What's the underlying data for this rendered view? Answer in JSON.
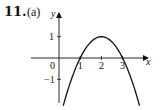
{
  "problem": {
    "number": "11.",
    "part": "(a)"
  },
  "chart_data": {
    "type": "line",
    "title": "",
    "xlabel": "x",
    "ylabel": "y",
    "function": "y = -(x-2)^2 + 1",
    "x_ticks": [
      1,
      2,
      3
    ],
    "x_tick_labels": [
      "1",
      "2",
      "3"
    ],
    "y_ticks": [
      1,
      -1
    ],
    "y_tick_labels": [
      "1",
      "−1"
    ],
    "origin_label": "0",
    "xlim": [
      -1.7,
      4.2
    ],
    "ylim": [
      -2.3,
      2.2
    ],
    "grid": false,
    "series": [
      {
        "name": "parabola",
        "x": [
          0.2,
          0.5,
          1.0,
          1.5,
          2.0,
          2.5,
          3.0,
          3.5,
          3.8
        ],
        "y": [
          -2.24,
          -1.25,
          0.0,
          0.75,
          1.0,
          0.75,
          0.0,
          -1.25,
          -2.24
        ]
      }
    ],
    "annotations": {
      "vertex": [
        2,
        1
      ],
      "x_intercepts": [
        1,
        3
      ]
    }
  },
  "colors": {
    "ink": "#111111",
    "background": "#ffffff"
  }
}
